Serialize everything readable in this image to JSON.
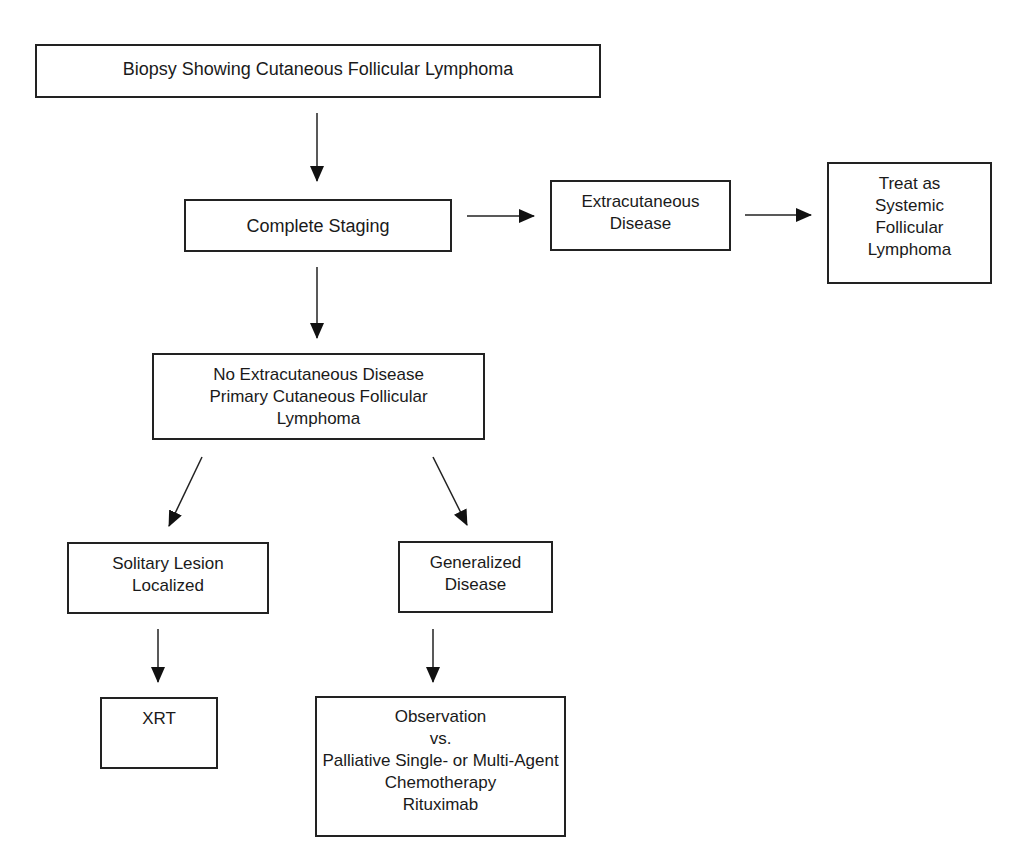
{
  "diagram": {
    "type": "flowchart",
    "nodes": {
      "biopsy": {
        "lines": [
          "Biopsy Showing Cutaneous Follicular Lymphoma"
        ]
      },
      "staging": {
        "lines": [
          "Complete Staging"
        ]
      },
      "extracutaneous": {
        "lines": [
          "Extracutaneous",
          "Disease"
        ]
      },
      "systemic": {
        "lines": [
          "Treat as",
          "Systemic",
          "Follicular",
          "Lymphoma"
        ]
      },
      "primary": {
        "lines": [
          "No Extracutaneous Disease",
          "Primary Cutaneous Follicular",
          "Lymphoma"
        ]
      },
      "solitary": {
        "lines": [
          "Solitary Lesion",
          "Localized"
        ]
      },
      "generalized": {
        "lines": [
          "Generalized",
          "Disease"
        ]
      },
      "xrt": {
        "lines": [
          "XRT"
        ]
      },
      "treatment": {
        "lines": [
          "Observation",
          "vs.",
          "Palliative Single- or Multi-Agent",
          "Chemotherapy",
          "Rituximab"
        ]
      }
    },
    "edges": [
      {
        "from": "biopsy",
        "to": "staging"
      },
      {
        "from": "staging",
        "to": "extracutaneous"
      },
      {
        "from": "extracutaneous",
        "to": "systemic"
      },
      {
        "from": "staging",
        "to": "primary"
      },
      {
        "from": "primary",
        "to": "solitary"
      },
      {
        "from": "primary",
        "to": "generalized"
      },
      {
        "from": "solitary",
        "to": "xrt"
      },
      {
        "from": "generalized",
        "to": "treatment"
      }
    ],
    "colors": {
      "stroke": "#222222",
      "background": "#ffffff",
      "text": "#1a1a1a"
    }
  }
}
